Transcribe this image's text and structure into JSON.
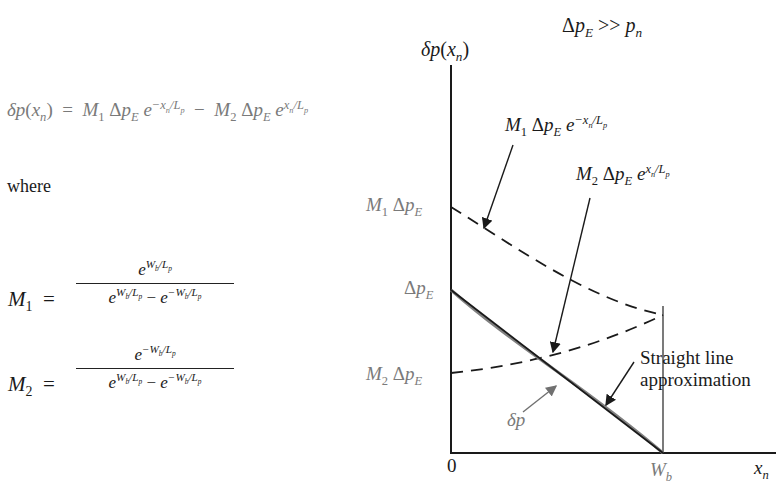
{
  "equation_main": {
    "lhs": "δp(x",
    "lhs_sub": "n",
    "lhs_close": ")",
    "eq": "=",
    "term1_coef": "M",
    "term1_coef_sub": "1",
    "term1_delta": "Δp",
    "term1_delta_sub": "E",
    "term1_exp_base": "e",
    "term1_exp": "−x",
    "term1_exp_sub": "n",
    "term1_exp_tail": "/L",
    "term1_exp_tail_sub": "p",
    "minus": "−",
    "term2_coef": "M",
    "term2_coef_sub": "2",
    "term2_delta": "Δp",
    "term2_delta_sub": "E",
    "term2_exp_base": "e",
    "term2_exp": "x",
    "term2_exp_sub": "n",
    "term2_exp_tail": "/L",
    "term2_exp_tail_sub": "p"
  },
  "where_label": "where",
  "m1_def": {
    "name": "M",
    "name_sub": "1",
    "eq": "=",
    "numerator": "e^(W_b/L_p)",
    "denominator": "e^(W_b/L_p) − e^(−W_b/L_p)"
  },
  "m2_def": {
    "name": "M",
    "name_sub": "2",
    "eq": "=",
    "numerator": "e^(−W_b/L_p)",
    "denominator": "e^(W_b/L_p) − e^(−W_b/L_p)"
  },
  "plot": {
    "condition": "Δp_E >> p_n",
    "y_axis_label": "δp(x_n)",
    "x_axis_label": "x_n",
    "x_ticks": [
      "0",
      "W_b"
    ],
    "y_levels": [
      "M_1 Δp_E",
      "Δp_E",
      "M_2 Δp_E"
    ],
    "curve_labels": {
      "m1_curve": "M_1 Δp_E e^(−x_n/L_p)",
      "m2_curve": "M_2 Δp_E e^(x_n/L_p)",
      "straight": "Straight line",
      "straight2": "approximation",
      "delta_p": "δp"
    }
  }
}
